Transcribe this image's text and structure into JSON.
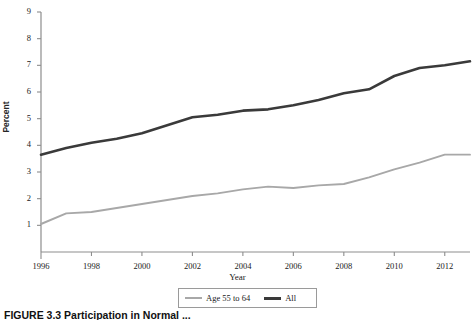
{
  "figure": {
    "caption": "FIGURE 3.3  Participation in Normal ...",
    "ylabel": "Percent",
    "xlabel": "Year"
  },
  "legend": {
    "entries": [
      {
        "label": "Age 55 to 64",
        "color": "#a8a8a8",
        "swatch": "light-line-swatch"
      },
      {
        "label": "All",
        "color": "#3a3a3a",
        "swatch": "dark-line-swatch"
      }
    ]
  },
  "axes": {
    "y_ticks": [
      "1",
      "2",
      "3",
      "4",
      "5",
      "6",
      "7",
      "8",
      "9"
    ],
    "x_ticks": [
      "1996",
      "1998",
      "2000",
      "2002",
      "2004",
      "2006",
      "2008",
      "2010",
      "2012"
    ]
  },
  "chart_data": {
    "type": "line",
    "title": "",
    "xlabel": "Year",
    "ylabel": "Percent",
    "xlim": [
      1996,
      2013
    ],
    "ylim": [
      0,
      9
    ],
    "yticks": [
      1,
      2,
      3,
      4,
      5,
      6,
      7,
      8,
      9
    ],
    "xticks": [
      1996,
      1998,
      2000,
      2002,
      2004,
      2006,
      2008,
      2010,
      2012
    ],
    "grid": false,
    "legend_position": "below-axes",
    "x": [
      1996,
      1997,
      1998,
      1999,
      2000,
      2001,
      2002,
      2003,
      2004,
      2005,
      2006,
      2007,
      2008,
      2009,
      2010,
      2011,
      2012,
      2013
    ],
    "series": [
      {
        "name": "All",
        "color": "#3a3a3a",
        "values": [
          3.65,
          3.9,
          4.1,
          4.25,
          4.45,
          4.75,
          5.05,
          5.15,
          5.3,
          5.35,
          5.5,
          5.7,
          5.95,
          6.1,
          6.6,
          6.9,
          7.0,
          7.15
        ]
      },
      {
        "name": "Age 55 to 64",
        "color": "#a8a8a8",
        "values": [
          1.05,
          1.45,
          1.5,
          1.65,
          1.8,
          1.95,
          2.1,
          2.2,
          2.35,
          2.45,
          2.4,
          2.5,
          2.55,
          2.8,
          3.1,
          3.35,
          3.65,
          3.65
        ]
      }
    ]
  }
}
